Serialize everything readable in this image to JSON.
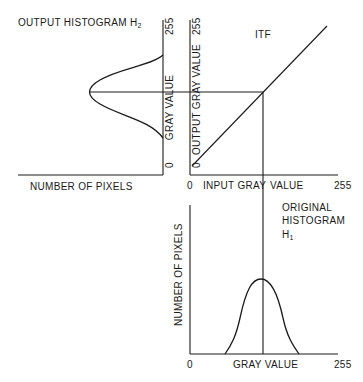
{
  "diagram": {
    "output_histogram": {
      "title": "OUTPUT HISTOGRAM H",
      "title_subscript": "2",
      "x_label": "NUMBER OF PIXELS",
      "y_label": "GRAY VALUE",
      "y_min": "0",
      "y_max": "255"
    },
    "itf": {
      "title": "ITF",
      "x_label_left": "INPUT GRAY",
      "x_label_right": "VALUE",
      "y_label": "OUTPUT GRAY   VALUE",
      "x_min": "0",
      "x_max": "255",
      "y_min": "0",
      "y_max": "255"
    },
    "original_histogram": {
      "title_line1": "ORIGINAL",
      "title_line2": "HISTOGRAM",
      "title_line3": "H",
      "title_subscript": "1",
      "x_label": "GRAY VALUE",
      "y_label": "NUMBER OF PIXELS",
      "x_min": "0",
      "x_max": "255"
    }
  }
}
